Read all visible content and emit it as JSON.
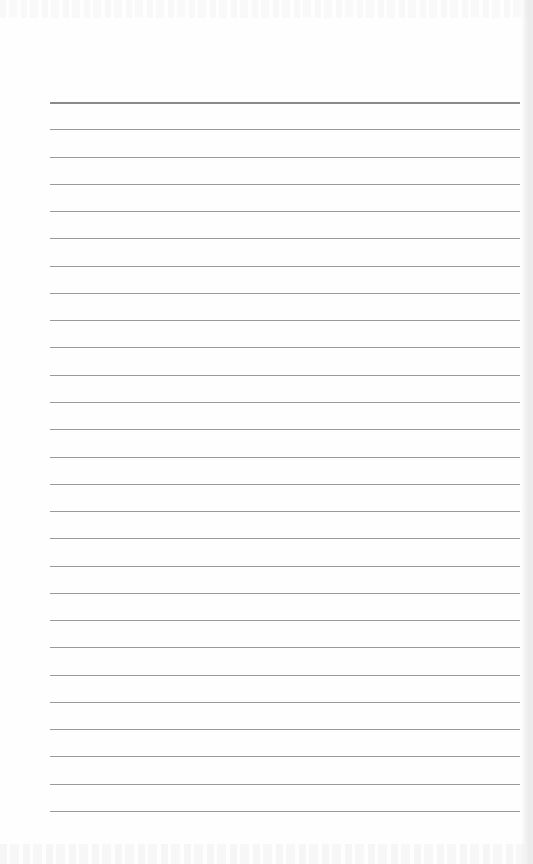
{
  "document": {
    "type": "lined-paper",
    "text_content": "",
    "rules": {
      "count": 27,
      "first_y": 102,
      "pitch": 27.27,
      "x_start": 50,
      "x_end": 520,
      "header_rule_index": 0
    },
    "colors": {
      "paper": "#fefefe",
      "rule": "#9a9a9a",
      "header_rule": "#8a8a8a"
    }
  }
}
